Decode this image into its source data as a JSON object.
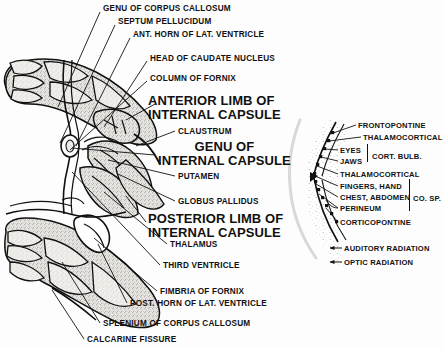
{
  "figure": {
    "background_color": "#fdfdfd",
    "ink_color": "#111111"
  },
  "left_figure": {
    "name": "horizontal-brain-section",
    "small_labels": [
      {
        "id": "genu-corpus-callosum",
        "text": "GENU OF CORPUS CALLOSUM",
        "x": 103,
        "y": 5
      },
      {
        "id": "septum-pellucidum",
        "text": "SEPTUM PELLUCIDUM",
        "x": 118,
        "y": 18
      },
      {
        "id": "ant-horn-lat-ventricle",
        "text": "ANT. HORN OF LAT. VENTRICLE",
        "x": 133,
        "y": 31
      },
      {
        "id": "head-caudate-nucleus",
        "text": "HEAD OF CAUDATE NUCLEUS",
        "x": 150,
        "y": 55
      },
      {
        "id": "column-of-fornix",
        "text": "COLUMN OF FORNIX",
        "x": 150,
        "y": 75
      },
      {
        "id": "claustrum",
        "text": "CLAUSTRUM",
        "x": 178,
        "y": 128
      },
      {
        "id": "putamen",
        "text": "PUTAMEN",
        "x": 178,
        "y": 173
      },
      {
        "id": "globus-pallidus",
        "text": "GLOBUS PALLIDUS",
        "x": 178,
        "y": 198
      },
      {
        "id": "thalamus",
        "text": "THALAMUS",
        "x": 170,
        "y": 241
      },
      {
        "id": "third-ventricle",
        "text": "THIRD VENTRICLE",
        "x": 163,
        "y": 262
      },
      {
        "id": "fimbria-of-fornix",
        "text": "FIMBRIA OF FORNIX",
        "x": 160,
        "y": 288
      },
      {
        "id": "post-horn-lat-ventricle",
        "text": "POST. HORN OF LAT. VENTRICLE",
        "x": 130,
        "y": 300
      },
      {
        "id": "splenium-corpus-callosum",
        "text": "SPLENIUM OF CORPUS CALLOSUM",
        "x": 103,
        "y": 320
      },
      {
        "id": "calcarine-fissure",
        "text": "CALCARINE FISSURE",
        "x": 87,
        "y": 336
      }
    ],
    "big_labels": [
      {
        "id": "anterior-limb-internal-capsule",
        "line1": "ANTERIOR LIMB OF",
        "line2": "INTERNAL CAPSULE",
        "x": 148,
        "y": 94,
        "centered": false
      },
      {
        "id": "genu-internal-capsule",
        "line1": "GENU   OF",
        "line2": "INTERNAL CAPSULE",
        "x": 158,
        "y": 140,
        "centered": true
      },
      {
        "id": "posterior-limb-internal-capsule",
        "line1": "POSTERIOR LIMB OF",
        "line2": "INTERNAL CAPSULE",
        "x": 148,
        "y": 212,
        "centered": false
      }
    ]
  },
  "right_figure": {
    "name": "internal-capsule-fiber-topography",
    "labels": [
      {
        "id": "frontopontine",
        "text": "FRONTOPONTINE",
        "x": 358,
        "y": 122
      },
      {
        "id": "thalamocortical-1",
        "text": "THALAMOCORTICAL",
        "x": 363,
        "y": 134
      },
      {
        "id": "eyes",
        "text": "EYES",
        "x": 340,
        "y": 147
      },
      {
        "id": "jaws",
        "text": "JAWS",
        "x": 340,
        "y": 158
      },
      {
        "id": "thalamocortical-2",
        "text": "THALAMOCORTICAL",
        "x": 340,
        "y": 171
      },
      {
        "id": "fingers-hand",
        "text": "FINGERS, HAND",
        "x": 340,
        "y": 183
      },
      {
        "id": "chest-abdomen",
        "text": "CHEST, ABDOMEN",
        "x": 340,
        "y": 194
      },
      {
        "id": "perineum",
        "text": "PERINEUM",
        "x": 340,
        "y": 205
      },
      {
        "id": "corticopontine",
        "text": "CORTICOPONTINE",
        "x": 340,
        "y": 219
      },
      {
        "id": "auditory-radiation",
        "text": "AUDITORY RADIATION",
        "x": 344,
        "y": 245
      },
      {
        "id": "optic-radiation",
        "text": "OPTIC RADIATION",
        "x": 344,
        "y": 259
      }
    ],
    "bracket_labels": [
      {
        "id": "cort-bulb",
        "text": "CORT. BULB.",
        "x": 372,
        "y": 152,
        "bracket_x": 367,
        "bracket_y": 144,
        "bracket_h": 18
      },
      {
        "id": "co-sp",
        "text": "CO. SP.",
        "x": 413,
        "y": 194,
        "bracket_x": 409,
        "bracket_y": 179,
        "bracket_h": 32
      }
    ]
  }
}
